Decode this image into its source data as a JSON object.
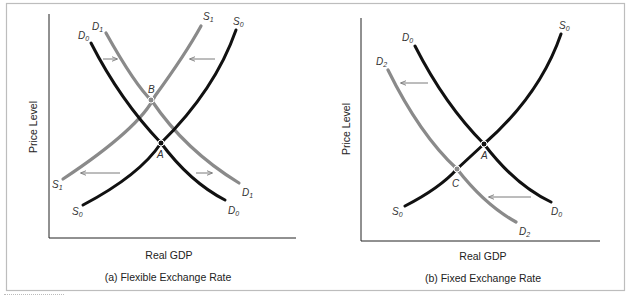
{
  "figure": {
    "panel_a": {
      "caption": "(a)  Flexible Exchange Rate",
      "xlabel": "Real GDP",
      "ylabel": "Price Level",
      "curves": {
        "D0": {
          "label": "D",
          "sub": "0",
          "color": "#111111"
        },
        "D1": {
          "label": "D",
          "sub": "1",
          "color": "#8a8a8a"
        },
        "S0": {
          "label": "S",
          "sub": "0",
          "color": "#111111"
        },
        "S1": {
          "label": "S",
          "sub": "1",
          "color": "#8a8a8a"
        }
      },
      "points": {
        "A": "A",
        "B": "B"
      }
    },
    "panel_b": {
      "caption": "(b)  Fixed Exchange Rate",
      "xlabel": "Real GDP",
      "ylabel": "Price Level",
      "curves": {
        "D0": {
          "label": "D",
          "sub": "0",
          "color": "#111111"
        },
        "D2": {
          "label": "D",
          "sub": "2",
          "color": "#8a8a8a"
        },
        "S0": {
          "label": "S",
          "sub": "0",
          "color": "#111111"
        }
      },
      "points": {
        "A": "A",
        "C": "C"
      }
    }
  },
  "colors": {
    "black_curve": "#111111",
    "gray_curve": "#8a8a8a",
    "arrow": "#7a7a7a",
    "frame": "#bdbdbd"
  }
}
